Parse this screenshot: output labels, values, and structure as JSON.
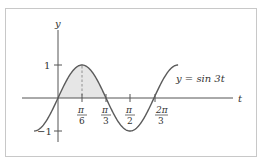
{
  "chart_data": {
    "type": "line",
    "title": "",
    "function_label": "y = sin 3t",
    "xlabel": "t",
    "ylabel": "y",
    "x_ticks": [
      {
        "value": 0.5236,
        "label_num": "π",
        "label_den": "6"
      },
      {
        "value": 1.0472,
        "label_num": "π",
        "label_den": "3"
      },
      {
        "value": 1.5708,
        "label_num": "π",
        "label_den": "2"
      },
      {
        "value": 2.0944,
        "label_num": "2π",
        "label_den": "3"
      }
    ],
    "y_ticks": [
      {
        "value": 1,
        "label": "1"
      },
      {
        "value": -1,
        "label": "−1"
      }
    ],
    "x_range": [
      -0.55,
      2.65
    ],
    "y_range": [
      -1.3,
      1.6
    ],
    "shaded_region": {
      "from": 0,
      "to": 1.0472,
      "description": "area under y = sin 3t between 0 and π/3"
    },
    "dashed_line_at": 0.5236,
    "grid": false,
    "legend": "none"
  },
  "labels": {
    "y_axis": "y",
    "t_axis": "t",
    "equation": "y = sin 3t",
    "tick_one": "1",
    "tick_minus_one": "−1",
    "pi6_num": "π",
    "pi6_den": "6",
    "pi3_num": "π",
    "pi3_den": "3",
    "pi2_num": "π",
    "pi2_den": "2",
    "two_pi3_num": "2π",
    "two_pi3_den": "3"
  },
  "colors": {
    "curve": "#5a5a5a",
    "shade": "#e6e6e6",
    "axis": "#555555",
    "frame": "#c8c8c8"
  }
}
